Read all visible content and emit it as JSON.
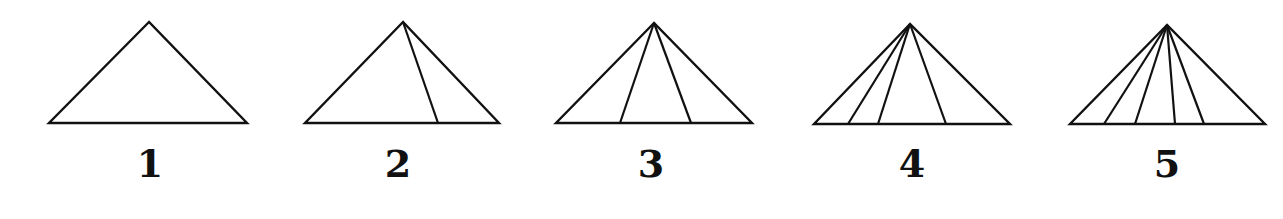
{
  "figure": {
    "stroke_color": "#111111",
    "background": "#ffffff",
    "triangles": [
      {
        "label": "1",
        "apex": [
          149,
          22
        ],
        "base_left": [
          49,
          123
        ],
        "base_right": [
          247,
          123
        ],
        "interior_base_x": [],
        "label_pos": [
          150,
          145
        ]
      },
      {
        "label": "2",
        "apex": [
          403,
          22
        ],
        "base_left": [
          305,
          123
        ],
        "base_right": [
          499,
          123
        ],
        "interior_base_x": [
          438
        ],
        "label_pos": [
          398,
          145
        ]
      },
      {
        "label": "3",
        "apex": [
          654,
          23
        ],
        "base_left": [
          556,
          123
        ],
        "base_right": [
          752,
          123
        ],
        "interior_base_x": [
          620,
          691
        ],
        "label_pos": [
          651,
          145
        ]
      },
      {
        "label": "4",
        "apex": [
          910,
          24
        ],
        "base_left": [
          814,
          124
        ],
        "base_right": [
          1010,
          124
        ],
        "interior_base_x": [
          848,
          878,
          946
        ],
        "label_pos": [
          912,
          145
        ]
      },
      {
        "label": "5",
        "apex": [
          1167,
          25
        ],
        "base_left": [
          1070,
          124
        ],
        "base_right": [
          1265,
          124
        ],
        "interior_base_x": [
          1104,
          1135,
          1175,
          1204
        ],
        "label_pos": [
          1167,
          145
        ]
      }
    ]
  }
}
